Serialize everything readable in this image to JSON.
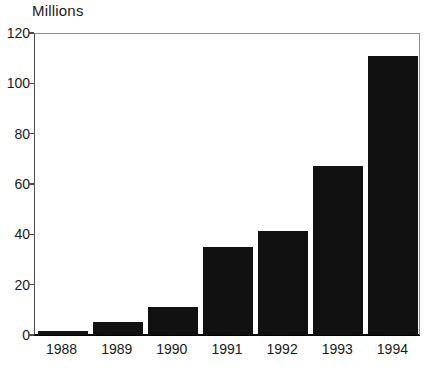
{
  "chart_data": {
    "type": "bar",
    "title": "Millions",
    "xlabel": "",
    "ylabel": "Millions",
    "categories": [
      "1988",
      "1989",
      "1990",
      "1991",
      "1992",
      "1993",
      "1994"
    ],
    "values": [
      1.5,
      5,
      11,
      35,
      41.5,
      67,
      111
    ],
    "ylim": [
      0,
      120
    ],
    "yticks": [
      0,
      20,
      40,
      60,
      80,
      100,
      120
    ],
    "ytick_labels": [
      "0",
      "20",
      "40",
      "60",
      "80",
      "100",
      "120"
    ],
    "grid": false,
    "legend": null,
    "bar_color": "#111111",
    "background_color": "#ffffff",
    "axis_color": "#4d4d4d"
  }
}
